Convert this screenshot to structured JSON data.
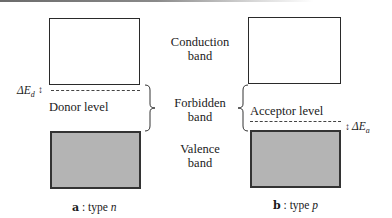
{
  "center_labels": {
    "conduction": [
      "Conduction",
      "band"
    ],
    "forbidden": [
      "Forbidden",
      "band"
    ],
    "valence": [
      "Valence",
      "band"
    ]
  },
  "panel_a": {
    "level_label": "Donor level",
    "delta_symbol": "ΔE",
    "delta_subscript": "d",
    "caption_letter": "a",
    "caption_sep": " : type ",
    "caption_type": "n"
  },
  "panel_b": {
    "level_label": "Acceptor level",
    "delta_symbol": "ΔE",
    "delta_subscript": "a",
    "caption_letter": "b",
    "caption_sep": " : type ",
    "caption_type": "p"
  },
  "colors": {
    "outline": "#2a2a2a",
    "valence_fill": "#b4b4b4",
    "background": "#ffffff"
  },
  "arrow_glyph": "↕"
}
